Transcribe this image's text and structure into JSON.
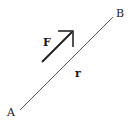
{
  "diagram": {
    "type": "vector-diagram",
    "points": {
      "A": {
        "label": "A",
        "x": 20,
        "y": 110
      },
      "B": {
        "label": "B",
        "x": 113,
        "y": 17
      }
    },
    "segment": {
      "from": "A",
      "to": "B",
      "label": "r",
      "color": "#555555"
    },
    "force_vector": {
      "label": "F",
      "color": "#1a1a1a",
      "direction": "parallel to AB, pointing toward B"
    }
  }
}
